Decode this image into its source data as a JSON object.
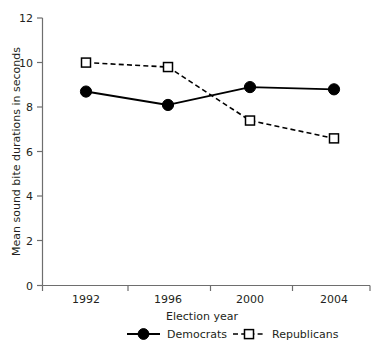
{
  "chart_data": {
    "type": "line",
    "title": "",
    "xlabel": "Election year",
    "ylabel": "Mean sound bite durations in seconds",
    "categories": [
      "1992",
      "1996",
      "2000",
      "2004"
    ],
    "series": [
      {
        "name": "Democrats",
        "values": [
          8.7,
          8.1,
          8.9,
          8.8
        ],
        "marker": "filled-circle",
        "line_style": "solid",
        "color": "#000000"
      },
      {
        "name": "Republicans",
        "values": [
          10.0,
          9.8,
          7.4,
          6.6
        ],
        "marker": "open-square",
        "line_style": "dashed",
        "color": "#000000"
      }
    ],
    "ylim": [
      0,
      12
    ],
    "yticks": [
      0,
      2,
      4,
      6,
      8,
      10,
      12
    ],
    "ytick_labels": [
      "0",
      "2",
      "4",
      "6",
      "8",
      "10",
      "12"
    ],
    "xtick_labels": [
      "1992",
      "1996",
      "2000",
      "2004"
    ],
    "grid": false,
    "legend_position": "bottom",
    "legend_entries": [
      "Democrats",
      "Republicans"
    ]
  },
  "axis": {
    "y_title": "Mean sound bite durations in seconds",
    "x_title": "Election year"
  },
  "legend": {
    "democrats_label": "Democrats",
    "republicans_label": "Republicans"
  },
  "style": {
    "background": "#ffffff",
    "axis_color": "#6e6e6e",
    "ink_color": "#000000"
  }
}
